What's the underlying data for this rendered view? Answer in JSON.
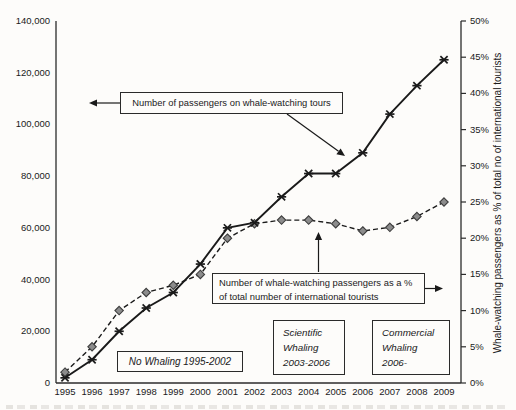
{
  "chart_data": {
    "type": "line",
    "title": "",
    "x": [
      1995,
      1996,
      1997,
      1998,
      1999,
      2000,
      2001,
      2002,
      2003,
      2004,
      2005,
      2006,
      2007,
      2008,
      2009
    ],
    "series": [
      {
        "name": "Number of passengers on whale-watching tours",
        "axis": "left",
        "line_style": "solid",
        "marker": "star-x",
        "color": "#1a1a1a",
        "values": [
          2000,
          9000,
          20000,
          29000,
          35000,
          46000,
          60000,
          62000,
          72000,
          81000,
          81000,
          89000,
          104000,
          115000,
          125000
        ]
      },
      {
        "name": "Number of whale-watching passengers as a % of total number of international tourists",
        "axis": "right",
        "line_style": "dashed",
        "marker": "diamond",
        "color": "#1a1a1a",
        "marker_fill": "#8c8c8c",
        "marker_edge": "#3d3d3d",
        "values": [
          1.5,
          5,
          10,
          12.5,
          13.5,
          15,
          20,
          22,
          22.5,
          22.5,
          22,
          21,
          21.5,
          23,
          25
        ]
      }
    ],
    "left_axis": {
      "min": 0,
      "max": 140000,
      "step": 20000,
      "tick_labels": [
        "0",
        "20,000",
        "40,000",
        "60,000",
        "80,000",
        "100,000",
        "120,000",
        "140,000"
      ]
    },
    "right_axis": {
      "min": 0,
      "max": 50,
      "step": 5,
      "unit": "%",
      "tick_labels": [
        "0%",
        "5%",
        "10%",
        "15%",
        "20%",
        "25%",
        "30%",
        "35%",
        "40%",
        "45%",
        "50%"
      ],
      "label": "Whale-watching passengers as % of total no of international tourists"
    },
    "grid": false,
    "legend": "annotated-callouts"
  },
  "annotations": {
    "passengers_callout": "Number of passengers on whale-watching tours",
    "percent_callout_line1": "Number of whale-watching passengers as a %",
    "percent_callout_line2": "of total number of international tourists",
    "no_whaling": "No Whaling 1995-2002",
    "scientific_line1": "Scientific",
    "scientific_line2": "Whaling",
    "scientific_line3": "2003-2006",
    "commercial_line1": "Commercial",
    "commercial_line2": "Whaling",
    "commercial_line3": "2006-"
  },
  "colors": {
    "line": "#1a1a1a",
    "diamond_fill": "#8c8c8c",
    "diamond_edge": "#3d3d3d",
    "axis": "#2b2b2b",
    "background": "#fdfcfa"
  }
}
